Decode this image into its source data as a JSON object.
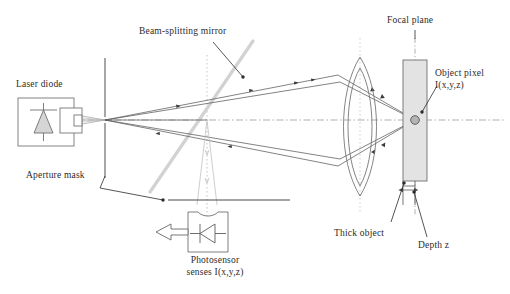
{
  "figure": {
    "domain": "diagram",
    "canvas": {
      "width": 510,
      "height": 294
    },
    "background_color": "#ffffff"
  },
  "colors": {
    "ink": "#2b2b2b",
    "ray_line": "#555555",
    "axis_dashdot": "#9a9a9a",
    "dotted_guide": "#b0b0b0",
    "beam_splitter": "#cfcfcf",
    "object_fill": "#e2e2e2",
    "object_stroke": "#6f6f6f",
    "component_stroke": "#6f6f6f",
    "diode_fill": "#d8d8d8",
    "pixel_dot": "#8a8a8a"
  },
  "labels": {
    "laser_diode": "Laser diode",
    "aperture_mask": "Aperture mask",
    "beam_splitting_mirror": "Beam-splitting mirror",
    "photosensor": "Photosensor\nsenses I(x,y,z)",
    "focal_plane": "Focal plane",
    "object_pixel": "Object pixel\nI(x,y,z)",
    "thick_object": "Thick object",
    "depth_z": "Depth z"
  },
  "components": [
    {
      "name": "laser-diode",
      "type": "source",
      "label": "Laser diode",
      "x": 18,
      "y": 98,
      "width": 62,
      "height": 48
    },
    {
      "name": "aperture-mask",
      "type": "mask",
      "label": "Aperture mask",
      "x": 105,
      "y": 58,
      "height": 120
    },
    {
      "name": "beam-splitting-mirror",
      "type": "mirror",
      "label": "Beam-splitting mirror",
      "angle_deg": -56
    },
    {
      "name": "photosensor",
      "type": "detector",
      "label": "Photosensor senses I(x,y,z)",
      "x": 188,
      "y": 212,
      "width": 40,
      "height": 40
    },
    {
      "name": "lens",
      "type": "biconvex-lens",
      "center_x": 360,
      "top_y": 57,
      "bottom_y": 196
    },
    {
      "name": "thick-object",
      "type": "volume",
      "label": "Thick object",
      "x": 403,
      "y": 60,
      "width": 24,
      "height": 121
    },
    {
      "name": "focal-plane",
      "type": "reference-plane",
      "label": "Focal plane",
      "x": 415
    },
    {
      "name": "object-pixel",
      "type": "point",
      "label": "Object pixel I(x,y,z)",
      "x": 415,
      "y": 120
    },
    {
      "name": "depth-z",
      "type": "measurement",
      "label": "Depth z",
      "from_x": 403,
      "to_x": 415,
      "y": 192
    }
  ],
  "geometry": {
    "optical_axis_y": 120,
    "pinhole_x": 105,
    "object_pixel_x": 415,
    "lens_center_x": 360,
    "beam_splitter_line": {
      "x1": 150,
      "y1": 190,
      "x2": 252,
      "y2": 42
    },
    "guide_dotted_x": 207
  }
}
